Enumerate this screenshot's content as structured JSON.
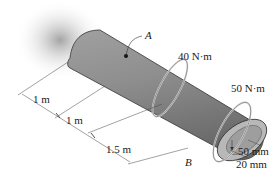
{
  "figure": {
    "type": "engineering-diagram",
    "points": [
      {
        "id": "A",
        "label": "A"
      },
      {
        "id": "B",
        "label": "B"
      }
    ],
    "torques": [
      {
        "id": "t1",
        "label": "40 N·m"
      },
      {
        "id": "t2",
        "label": "50 N·m"
      }
    ],
    "lengths": [
      {
        "id": "L1",
        "label": "1 m"
      },
      {
        "id": "L2",
        "label": "1 m"
      },
      {
        "id": "L3",
        "label": "1.5 m"
      }
    ],
    "radii": {
      "outer": "50 mm",
      "inner": "20 mm"
    },
    "colors": {
      "shaft_body": "#8a8a8a",
      "shaft_highlight": "#b4b4b4",
      "shaft_dark": "#5e5e5e",
      "end_face": "#a7a7a7",
      "wall_shadow": "#c8c8c8",
      "line": "#333333"
    }
  }
}
